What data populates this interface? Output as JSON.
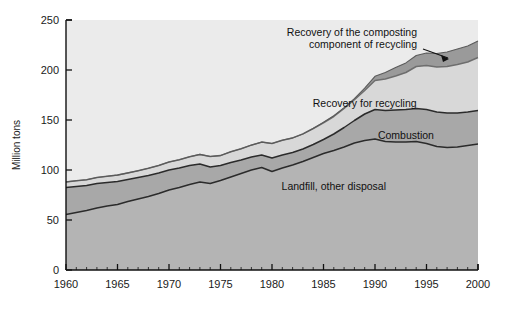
{
  "chart_data": {
    "type": "area",
    "stacked": true,
    "title": "",
    "subtitle": "",
    "xlabel": "",
    "ylabel": "Million tons",
    "xlim": [
      1960,
      2000
    ],
    "ylim": [
      0,
      250
    ],
    "grid": false,
    "legend_position": "inline-annotations",
    "xticks": [
      1960,
      1965,
      1970,
      1975,
      1980,
      1985,
      1990,
      1995,
      2000
    ],
    "xtick_labels": [
      "1960",
      "1965",
      "1970",
      "1975",
      "1980",
      "1985",
      "1990",
      "1995",
      "2000"
    ],
    "xminor_interval": 1,
    "yticks": [
      0,
      50,
      100,
      150,
      200,
      250
    ],
    "ytick_labels": [
      "0",
      "50",
      "100",
      "150",
      "200",
      "250"
    ],
    "x": [
      1960,
      1961,
      1962,
      1963,
      1964,
      1965,
      1966,
      1967,
      1968,
      1969,
      1970,
      1971,
      1972,
      1973,
      1974,
      1975,
      1976,
      1977,
      1978,
      1979,
      1980,
      1981,
      1982,
      1983,
      1984,
      1985,
      1986,
      1987,
      1988,
      1989,
      1990,
      1991,
      1992,
      1993,
      1994,
      1995,
      1996,
      1997,
      1998,
      1999,
      2000
    ],
    "series": [
      {
        "name": "Landfill, other disposal",
        "label": "Landfill, other disposal",
        "color": "#b4b4b4",
        "line_color": "#2b2b2b",
        "values": [
          55.5,
          57.5,
          59.5,
          62.0,
          64.0,
          65.5,
          68.5,
          71.0,
          73.5,
          76.5,
          80.0,
          82.5,
          85.5,
          88.0,
          86.5,
          89.5,
          93.0,
          96.5,
          100.0,
          102.5,
          98.5,
          102.0,
          105.0,
          108.5,
          112.5,
          116.5,
          119.5,
          123.0,
          127.0,
          129.5,
          131.0,
          128.5,
          128.0,
          128.0,
          128.5,
          126.5,
          123.5,
          122.5,
          123.0,
          124.5,
          126.0
        ]
      },
      {
        "name": "Combustion",
        "label": "Combustion",
        "color": "#a8a8a8",
        "line_color": "#2b2b2b",
        "values": [
          27.0,
          26.0,
          25.0,
          24.5,
          23.5,
          23.0,
          22.0,
          21.5,
          21.0,
          20.5,
          20.0,
          19.5,
          19.0,
          18.0,
          16.5,
          15.0,
          14.5,
          13.5,
          13.0,
          12.5,
          13.5,
          13.0,
          12.5,
          12.5,
          13.0,
          14.0,
          16.5,
          19.5,
          22.5,
          26.5,
          29.5,
          31.0,
          32.0,
          32.5,
          33.0,
          34.0,
          34.5,
          34.5,
          34.0,
          33.5,
          33.5
        ]
      },
      {
        "name": "Recovery for recycling",
        "label": "Recovery for recycling",
        "color": "#d8d8d8",
        "line_color": "#6e6e6e",
        "values": [
          5.6,
          5.7,
          5.8,
          6.0,
          6.2,
          6.4,
          6.6,
          6.8,
          7.2,
          7.5,
          8.0,
          8.3,
          8.8,
          9.6,
          10.5,
          9.9,
          10.7,
          11.2,
          11.9,
          12.9,
          14.5,
          14.8,
          14.6,
          15.1,
          16.0,
          16.7,
          17.5,
          19.0,
          20.7,
          23.5,
          29.0,
          31.5,
          34.0,
          37.0,
          42.0,
          44.0,
          45.0,
          46.5,
          48.5,
          50.0,
          53.0
        ]
      },
      {
        "name": "Recovery of the composting component of recycling",
        "label": "Recovery of the composting component of recycling",
        "color": "#9a9a9a",
        "line_color": "#5a5a5a",
        "values": [
          0,
          0,
          0,
          0,
          0,
          0,
          0,
          0,
          0,
          0,
          0,
          0,
          0,
          0,
          0,
          0,
          0,
          0,
          0,
          0,
          0,
          0,
          0,
          0,
          0,
          0.5,
          0.7,
          0.9,
          1.2,
          2.3,
          4.2,
          6.5,
          8.5,
          9.6,
          11.0,
          12.5,
          13.5,
          14.5,
          15.5,
          16.0,
          16.5
        ]
      }
    ],
    "annotations": [
      {
        "text_line_1": "Recovery of the composting",
        "text_line_2": "component of recycling",
        "target_x": 1990,
        "target_y": 203
      }
    ],
    "inline_labels": [
      {
        "text": "Recovery for recycling",
        "x": 1989,
        "y": 163
      },
      {
        "text": "Combustion",
        "x": 1993,
        "y": 131
      },
      {
        "text": "Landfill, other disposal",
        "x": 1986,
        "y": 80
      }
    ]
  },
  "axis": {
    "ylabel": "Million tons"
  }
}
